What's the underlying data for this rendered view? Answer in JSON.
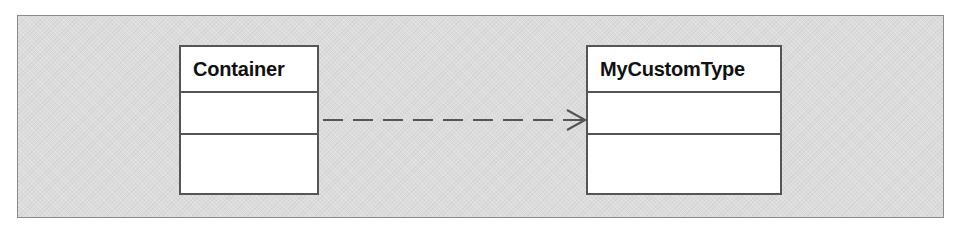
{
  "diagram": {
    "type": "UML class diagram",
    "classes": [
      {
        "name": "Container",
        "attributes": [],
        "operations": []
      },
      {
        "name": "MyCustomType",
        "attributes": [],
        "operations": []
      }
    ],
    "relationships": [
      {
        "from": "Container",
        "to": "MyCustomType",
        "kind": "dependency",
        "line": "dashed",
        "arrowhead": "open"
      }
    ]
  },
  "colors": {
    "panel_background": "#dcdcdc",
    "panel_border": "#8a8a8a",
    "box_fill": "#ffffff",
    "box_border": "#555555",
    "connector": "#555555"
  }
}
